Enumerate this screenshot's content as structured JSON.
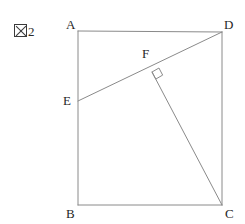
{
  "figure": {
    "caption_symbol": "figure-kanji-box",
    "caption_number": "2",
    "stroke_color": "#8a8a8a",
    "label_color": "#1f1f1f",
    "background_color": "#ffffff"
  },
  "labels": {
    "A": "A",
    "B": "B",
    "C": "C",
    "D": "D",
    "E": "E",
    "F": "F"
  },
  "chart_data": {
    "type": "diagram",
    "shape": "rectangle ABCD with segments ED and FC, right angle at F",
    "points": {
      "A": [
        78,
        31
      ],
      "B": [
        78,
        205
      ],
      "C": [
        222,
        205
      ],
      "D": [
        222,
        32
      ],
      "E": [
        78,
        101
      ],
      "F": [
        152,
        72
      ]
    },
    "segments": [
      {
        "name": "AB",
        "from": "A",
        "to": "B"
      },
      {
        "name": "BC",
        "from": "B",
        "to": "C"
      },
      {
        "name": "CD",
        "from": "C",
        "to": "D"
      },
      {
        "name": "DA",
        "from": "D",
        "to": "A"
      },
      {
        "name": "ED",
        "from": "E",
        "to": "D"
      },
      {
        "name": "FC",
        "from": "F",
        "to": "C"
      }
    ],
    "right_angle_marks": [
      {
        "at": "F",
        "between": [
          "ED",
          "FC"
        ]
      }
    ],
    "label_positions": {
      "A": [
        66,
        18
      ],
      "B": [
        66,
        207
      ],
      "C": [
        225,
        207
      ],
      "D": [
        224,
        18
      ],
      "E": [
        63,
        94
      ],
      "F": [
        142,
        47
      ]
    }
  }
}
